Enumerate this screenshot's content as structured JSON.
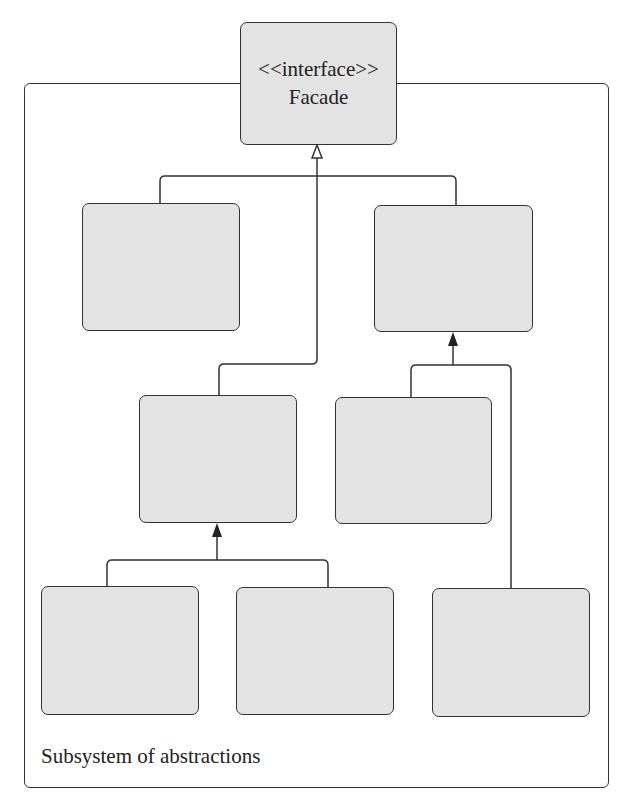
{
  "diagram": {
    "type": "uml-class-diagram",
    "frame": {
      "label": "Subsystem of abstractions"
    },
    "facade": {
      "stereotype": "<<interface>>",
      "name": "Facade"
    },
    "colors": {
      "box_fill": "#e3e3e3",
      "stroke": "#333333",
      "background": "#ffffff"
    },
    "nodes": [
      {
        "id": "facade",
        "label": "<<interface>> Facade"
      },
      {
        "id": "box-1",
        "label": ""
      },
      {
        "id": "box-2",
        "label": ""
      },
      {
        "id": "box-3",
        "label": ""
      },
      {
        "id": "box-4",
        "label": ""
      },
      {
        "id": "box-5",
        "label": ""
      },
      {
        "id": "box-6",
        "label": ""
      },
      {
        "id": "box-7",
        "label": ""
      }
    ],
    "edges": [
      {
        "from": "box-1",
        "to": "facade",
        "arrow": "hollow-triangle"
      },
      {
        "from": "box-2",
        "to": "facade",
        "arrow": "hollow-triangle"
      },
      {
        "from": "box-3",
        "to": "facade",
        "arrow": "hollow-triangle"
      },
      {
        "from": "box-4",
        "to": "box-2",
        "arrow": "filled"
      },
      {
        "from": "box-7",
        "to": "box-2",
        "arrow": "filled"
      },
      {
        "from": "box-5",
        "to": "box-3",
        "arrow": "filled"
      },
      {
        "from": "box-6",
        "to": "box-3",
        "arrow": "filled"
      }
    ]
  }
}
